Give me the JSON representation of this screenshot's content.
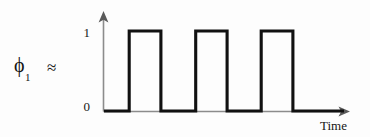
{
  "figure": {
    "signal_label": {
      "symbol": "ϕ",
      "subscript": "1",
      "relation": "≈"
    },
    "y_axis": {
      "ticks": [
        {
          "label": "1",
          "value": 1
        },
        {
          "label": "0",
          "value": 0
        }
      ],
      "arrow": "up-arrow-icon"
    },
    "x_axis": {
      "title": "Time",
      "arrow": "right-arrow-icon"
    },
    "colors": {
      "signal": "#111111",
      "axis": "#8c8c8c",
      "background": "#fdfdfd",
      "text": "#161616"
    }
  },
  "chart_data": {
    "type": "line",
    "title": "",
    "subtitle": "",
    "xlabel": "Time",
    "ylabel": "",
    "series": [
      {
        "name": "ϕ₁",
        "step": "post",
        "x": [
          0,
          0.105,
          0.105,
          0.237,
          0.237,
          0.382,
          0.382,
          0.513,
          0.513,
          0.655,
          0.655,
          0.787,
          0.787,
          0.93,
          0.93,
          1.0
        ],
        "y": [
          0,
          0,
          1,
          1,
          0,
          0,
          1,
          1,
          0,
          0,
          1,
          1,
          0,
          0,
          0,
          0
        ]
      }
    ],
    "pulses": [
      {
        "start": 0.105,
        "end": 0.237,
        "level": 1
      },
      {
        "start": 0.382,
        "end": 0.513,
        "level": 1
      },
      {
        "start": 0.655,
        "end": 0.787,
        "level": 1
      }
    ],
    "ylim": [
      0,
      1
    ],
    "xlim": [
      0,
      1
    ],
    "ytick_labels": [
      "0",
      "1"
    ],
    "ytick_values": [
      0,
      1
    ],
    "xtick_labels": [],
    "grid": false,
    "legend": false,
    "annotations": [
      {
        "text": "ϕ₁ ≈",
        "position": "left-of-axes"
      }
    ]
  }
}
